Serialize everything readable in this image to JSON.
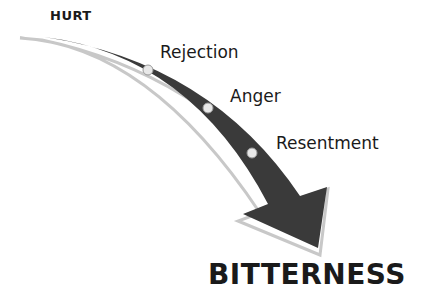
{
  "diagram": {
    "start_label": "HURT",
    "stages": [
      {
        "label": "Rejection"
      },
      {
        "label": "Anger"
      },
      {
        "label": "Resentment"
      }
    ],
    "end_label": "BITTERNESS",
    "colors": {
      "arrow_fill": "#3a3a3a",
      "arrow_shadow": "#c8c8c8",
      "dot_fill": "#e8e8e8",
      "text": "#1a1a1a",
      "background": "#ffffff"
    }
  }
}
